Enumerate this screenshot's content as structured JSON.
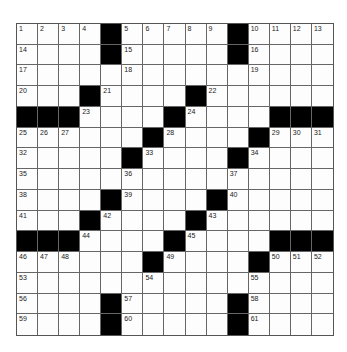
{
  "puzzle": {
    "rows": 15,
    "cols": 15,
    "colors": {
      "block": "#000000",
      "cell": "#fdfdfd",
      "line": "#666666"
    },
    "blacks": [
      [
        0,
        4
      ],
      [
        0,
        10
      ],
      [
        1,
        4
      ],
      [
        1,
        10
      ],
      [
        3,
        3
      ],
      [
        3,
        8
      ],
      [
        4,
        0
      ],
      [
        4,
        1
      ],
      [
        4,
        2
      ],
      [
        4,
        7
      ],
      [
        4,
        12
      ],
      [
        4,
        13
      ],
      [
        4,
        14
      ],
      [
        5,
        6
      ],
      [
        5,
        11
      ],
      [
        6,
        5
      ],
      [
        6,
        10
      ],
      [
        8,
        4
      ],
      [
        8,
        9
      ],
      [
        9,
        3
      ],
      [
        9,
        8
      ],
      [
        10,
        0
      ],
      [
        10,
        1
      ],
      [
        10,
        2
      ],
      [
        10,
        7
      ],
      [
        10,
        12
      ],
      [
        10,
        13
      ],
      [
        10,
        14
      ],
      [
        11,
        6
      ],
      [
        11,
        11
      ],
      [
        13,
        4
      ],
      [
        13,
        10
      ],
      [
        14,
        4
      ],
      [
        14,
        10
      ]
    ],
    "numbers": [
      {
        "r": 0,
        "c": 0,
        "n": "1"
      },
      {
        "r": 0,
        "c": 1,
        "n": "2"
      },
      {
        "r": 0,
        "c": 2,
        "n": "3"
      },
      {
        "r": 0,
        "c": 3,
        "n": "4"
      },
      {
        "r": 0,
        "c": 5,
        "n": "5"
      },
      {
        "r": 0,
        "c": 6,
        "n": "6"
      },
      {
        "r": 0,
        "c": 7,
        "n": "7"
      },
      {
        "r": 0,
        "c": 8,
        "n": "8"
      },
      {
        "r": 0,
        "c": 9,
        "n": "9"
      },
      {
        "r": 0,
        "c": 11,
        "n": "10"
      },
      {
        "r": 0,
        "c": 12,
        "n": "11"
      },
      {
        "r": 0,
        "c": 13,
        "n": "12"
      },
      {
        "r": 0,
        "c": 14,
        "n": "13"
      },
      {
        "r": 1,
        "c": 0,
        "n": "14"
      },
      {
        "r": 1,
        "c": 5,
        "n": "15"
      },
      {
        "r": 1,
        "c": 11,
        "n": "16"
      },
      {
        "r": 2,
        "c": 0,
        "n": "17"
      },
      {
        "r": 2,
        "c": 5,
        "n": "18"
      },
      {
        "r": 2,
        "c": 11,
        "n": "19"
      },
      {
        "r": 3,
        "c": 0,
        "n": "20"
      },
      {
        "r": 3,
        "c": 4,
        "n": "21"
      },
      {
        "r": 3,
        "c": 9,
        "n": "22"
      },
      {
        "r": 4,
        "c": 3,
        "n": "23"
      },
      {
        "r": 4,
        "c": 8,
        "n": "24"
      },
      {
        "r": 5,
        "c": 0,
        "n": "25"
      },
      {
        "r": 5,
        "c": 1,
        "n": "26"
      },
      {
        "r": 5,
        "c": 2,
        "n": "27"
      },
      {
        "r": 5,
        "c": 7,
        "n": "28"
      },
      {
        "r": 5,
        "c": 12,
        "n": "29"
      },
      {
        "r": 5,
        "c": 13,
        "n": "30"
      },
      {
        "r": 5,
        "c": 14,
        "n": "31"
      },
      {
        "r": 6,
        "c": 0,
        "n": "32"
      },
      {
        "r": 6,
        "c": 6,
        "n": "33"
      },
      {
        "r": 6,
        "c": 11,
        "n": "34"
      },
      {
        "r": 7,
        "c": 0,
        "n": "35"
      },
      {
        "r": 7,
        "c": 5,
        "n": "36"
      },
      {
        "r": 7,
        "c": 10,
        "n": "37"
      },
      {
        "r": 8,
        "c": 0,
        "n": "38"
      },
      {
        "r": 8,
        "c": 5,
        "n": "39"
      },
      {
        "r": 8,
        "c": 10,
        "n": "40"
      },
      {
        "r": 9,
        "c": 0,
        "n": "41"
      },
      {
        "r": 9,
        "c": 4,
        "n": "42"
      },
      {
        "r": 9,
        "c": 9,
        "n": "43"
      },
      {
        "r": 10,
        "c": 3,
        "n": "44"
      },
      {
        "r": 10,
        "c": 8,
        "n": "45"
      },
      {
        "r": 11,
        "c": 0,
        "n": "46"
      },
      {
        "r": 11,
        "c": 1,
        "n": "47"
      },
      {
        "r": 11,
        "c": 2,
        "n": "48"
      },
      {
        "r": 11,
        "c": 7,
        "n": "49"
      },
      {
        "r": 11,
        "c": 12,
        "n": "50"
      },
      {
        "r": 11,
        "c": 13,
        "n": "51"
      },
      {
        "r": 11,
        "c": 14,
        "n": "52"
      },
      {
        "r": 12,
        "c": 0,
        "n": "53"
      },
      {
        "r": 12,
        "c": 6,
        "n": "54"
      },
      {
        "r": 12,
        "c": 11,
        "n": "55"
      },
      {
        "r": 13,
        "c": 0,
        "n": "56"
      },
      {
        "r": 13,
        "c": 5,
        "n": "57"
      },
      {
        "r": 13,
        "c": 11,
        "n": "58"
      },
      {
        "r": 14,
        "c": 0,
        "n": "59"
      },
      {
        "r": 14,
        "c": 5,
        "n": "60"
      },
      {
        "r": 14,
        "c": 11,
        "n": "61"
      }
    ]
  }
}
